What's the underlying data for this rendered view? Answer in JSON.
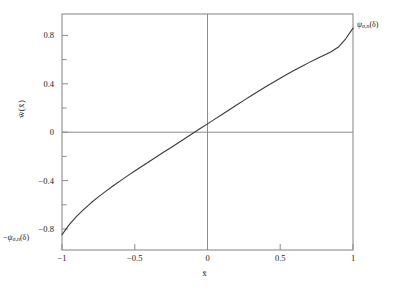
{
  "chart_data": {
    "type": "line",
    "title": "",
    "xlabel": "x̄",
    "ylabel": "w̄(x̄)",
    "xlim": [
      -1,
      1
    ],
    "ylim": [
      -1.0,
      1.0
    ],
    "grid": false,
    "legend": "none",
    "xticks": [
      -1,
      -0.5,
      0,
      0.5,
      1
    ],
    "xticklabels": [
      "−1",
      "−0.5",
      "0",
      "0.5",
      "1"
    ],
    "yticks": [
      -0.8,
      -0.4,
      0,
      0.4,
      0.8
    ],
    "yticklabels": [
      "−0.8",
      "−0.4",
      "0",
      "0.4",
      "0.8"
    ],
    "yminorticks": [
      -1.0,
      -0.6,
      -0.2,
      0.2,
      0.6,
      1.0
    ],
    "zero_lines": {
      "vertical_at_x": 0,
      "horizontal_at_y": 0
    },
    "series": [
      {
        "name": "w̄(x̄)",
        "color": "#3a3a3a",
        "linewidth": 1.1,
        "x": [
          -1.0,
          -0.95,
          -0.9,
          -0.85,
          -0.8,
          -0.75,
          -0.7,
          -0.65,
          -0.6,
          -0.55,
          -0.5,
          -0.45,
          -0.4,
          -0.35,
          -0.3,
          -0.25,
          -0.2,
          -0.15,
          -0.1,
          -0.05,
          0.0,
          0.05,
          0.1,
          0.15,
          0.2,
          0.25,
          0.3,
          0.35,
          0.4,
          0.45,
          0.5,
          0.55,
          0.6,
          0.65,
          0.7,
          0.75,
          0.8,
          0.85,
          0.9,
          0.95,
          1.0
        ],
        "y": [
          -0.87,
          -0.785,
          -0.715,
          -0.655,
          -0.6,
          -0.55,
          -0.503,
          -0.458,
          -0.414,
          -0.372,
          -0.331,
          -0.29,
          -0.25,
          -0.21,
          -0.17,
          -0.131,
          -0.091,
          -0.051,
          -0.011,
          0.029,
          0.069,
          0.109,
          0.149,
          0.189,
          0.229,
          0.268,
          0.307,
          0.345,
          0.383,
          0.42,
          0.456,
          0.491,
          0.525,
          0.558,
          0.59,
          0.621,
          0.651,
          0.68,
          0.72,
          0.79,
          0.88
        ]
      }
    ],
    "annotations": [
      {
        "id": "upper-endpoint",
        "text": "ψσ,n(δ)",
        "at_x": 1.0,
        "at_y": 0.88,
        "position": "right-of-axis-top"
      },
      {
        "id": "lower-endpoint",
        "text": "−ψσ,n(δ)",
        "at_x": -1.0,
        "at_y": -1.0,
        "position": "left-of-axis-bottom"
      }
    ]
  },
  "axes": {
    "y_axis_title": "w̄(x̄)",
    "x_axis_title": "x̄",
    "frame_color": "#8c8c8c",
    "curve_color": "#3a3a3a",
    "background": "#ffffff"
  },
  "labels": {
    "xticks": [
      "−1",
      "−0.5",
      "0",
      "0.5",
      "1"
    ],
    "yticks": [
      "0.8",
      "0.4",
      "0",
      "−0.4",
      "−0.8"
    ],
    "psi_upper": {
      "symbol": "ψ",
      "subscript": "σ,n",
      "argument": "(δ)"
    },
    "psi_lower": {
      "minus": "−",
      "symbol": "ψ",
      "subscript": "σ,n",
      "argument": "(δ)"
    }
  }
}
